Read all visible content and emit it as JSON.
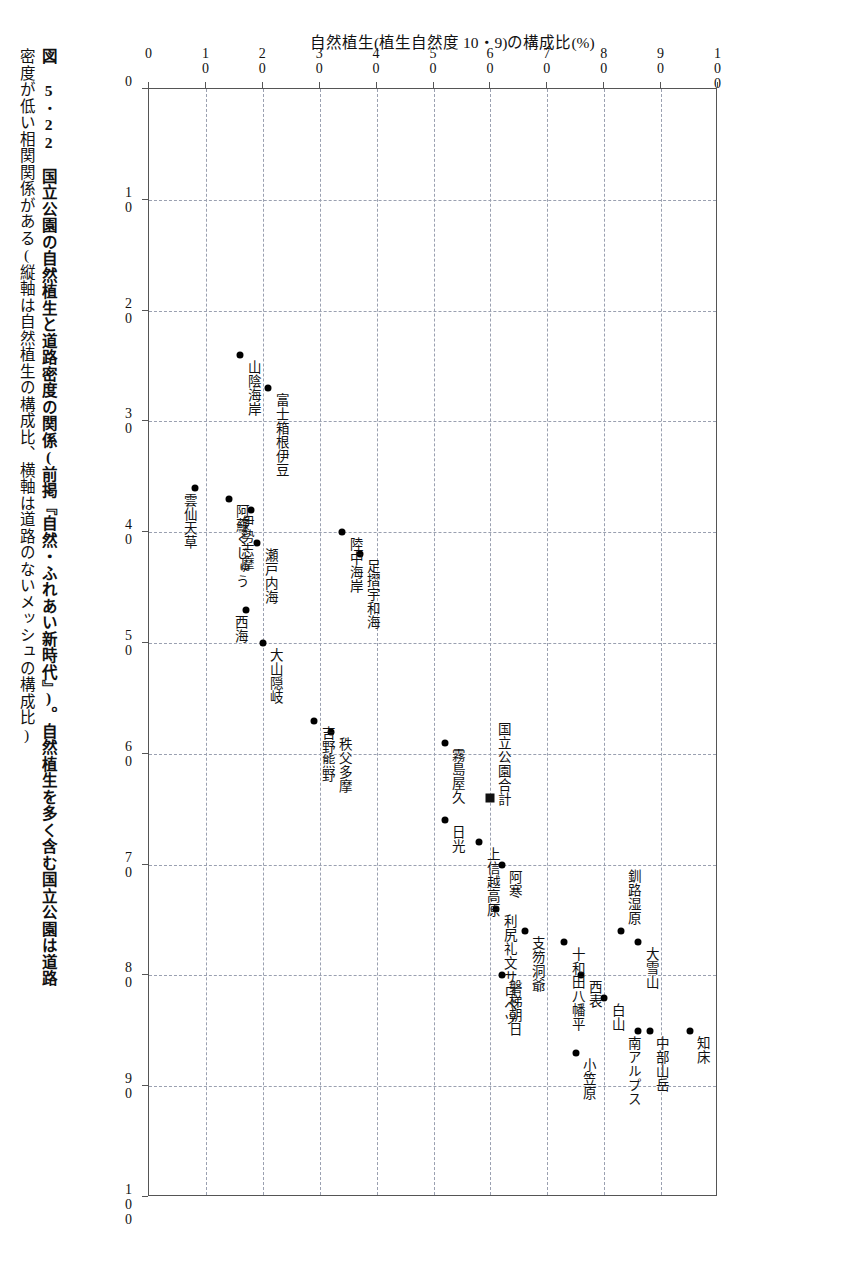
{
  "figure": {
    "number": "図 5･22",
    "caption_line1": "図 5･22　国立公園の自然植生と道路密度の関係(前掲『自然・ふれあい新時代』)。自然植生を多く含む国立公園は道路",
    "caption_line2": "密度が低い相関関係がある(縦軸は自然植生の構成比、横軸は道路のないメッシュの構成比)"
  },
  "chart_data": {
    "type": "scatter",
    "title": "",
    "xlabel": "道路(幅員 2.5 m 以上)が0本のメッシュ構成比(%)",
    "ylabel": "自然植生(植生自然度 10・9)の構成比(%)",
    "xlim": [
      0,
      100
    ],
    "ylim": [
      0,
      100
    ],
    "xticks": [
      0,
      10,
      20,
      30,
      40,
      50,
      60,
      70,
      80,
      90,
      100
    ],
    "yticks": [
      0,
      10,
      20,
      30,
      40,
      50,
      60,
      70,
      80,
      90,
      100
    ],
    "grid": "dashed",
    "legend": "none",
    "points": [
      {
        "label": "知床",
        "x": 85,
        "y": 95,
        "marker": "circle",
        "lbl_dx": 6,
        "lbl_dy": 5
      },
      {
        "label": "中部山岳",
        "x": 85,
        "y": 88,
        "marker": "circle",
        "lbl_dx": 5,
        "lbl_dy": 5
      },
      {
        "label": "南アルプス",
        "x": 85,
        "y": 86,
        "marker": "circle",
        "lbl_dx": -12,
        "lbl_dy": 5
      },
      {
        "label": "大雪山",
        "x": 77,
        "y": 86,
        "marker": "circle",
        "lbl_dx": 6,
        "lbl_dy": 5
      },
      {
        "label": "釧路湿原",
        "x": 76,
        "y": 83,
        "marker": "circle",
        "lbl_dx": 5,
        "lbl_dy": -62
      },
      {
        "label": "白山",
        "x": 82,
        "y": 80,
        "marker": "circle",
        "lbl_dx": 6,
        "lbl_dy": 5
      },
      {
        "label": "西表",
        "x": 80,
        "y": 76,
        "marker": "circle",
        "lbl_dx": 6,
        "lbl_dy": 5
      },
      {
        "label": "小笠原",
        "x": 87,
        "y": 75,
        "marker": "circle",
        "lbl_dx": 6,
        "lbl_dy": 5
      },
      {
        "label": "十和田八幡平",
        "x": 77,
        "y": 73,
        "marker": "circle",
        "lbl_dx": 6,
        "lbl_dy": 5
      },
      {
        "label": "支笏洞爺",
        "x": 76,
        "y": 66,
        "marker": "circle",
        "lbl_dx": 6,
        "lbl_dy": 5
      },
      {
        "label": "磐梯朝日",
        "x": 80,
        "y": 62,
        "marker": "circle",
        "lbl_dx": 6,
        "lbl_dy": 5
      },
      {
        "label": "利尻礼文サロベツ",
        "x": 74,
        "y": 61,
        "marker": "circle",
        "lbl_dx": 6,
        "lbl_dy": 5
      },
      {
        "label": "阿寒",
        "x": 70,
        "y": 62,
        "marker": "circle",
        "lbl_dx": 6,
        "lbl_dy": 5
      },
      {
        "label": "上信越高原",
        "x": 68,
        "y": 58,
        "marker": "circle",
        "lbl_dx": 6,
        "lbl_dy": 5
      },
      {
        "label": "国立公園合計",
        "x": 64,
        "y": 60,
        "marker": "square",
        "lbl_dx": 6,
        "lbl_dy": -76
      },
      {
        "label": "霧島屋久",
        "x": 59,
        "y": 52,
        "marker": "circle",
        "lbl_dx": 6,
        "lbl_dy": 5
      },
      {
        "label": "日光",
        "x": 66,
        "y": 52,
        "marker": "circle",
        "lbl_dx": 6,
        "lbl_dy": 5
      },
      {
        "label": "秩父多摩",
        "x": 58,
        "y": 32,
        "marker": "circle",
        "lbl_dx": 6,
        "lbl_dy": 5
      },
      {
        "label": "吉野熊野",
        "x": 57,
        "y": 29,
        "marker": "circle",
        "lbl_dx": 6,
        "lbl_dy": 5
      },
      {
        "label": "足摺宇和海",
        "x": 42,
        "y": 37,
        "marker": "circle",
        "lbl_dx": 6,
        "lbl_dy": 5
      },
      {
        "label": "陸中海岸",
        "x": 40,
        "y": 34,
        "marker": "circle",
        "lbl_dx": 6,
        "lbl_dy": 5
      },
      {
        "label": "大山隠岐",
        "x": 50,
        "y": 20,
        "marker": "circle",
        "lbl_dx": 6,
        "lbl_dy": 5
      },
      {
        "label": "西海",
        "x": 47,
        "y": 17,
        "marker": "circle",
        "lbl_dx": -12,
        "lbl_dy": 5
      },
      {
        "label": "瀬戸内海",
        "x": 41,
        "y": 19,
        "marker": "circle",
        "lbl_dx": 6,
        "lbl_dy": 5
      },
      {
        "label": "伊勢志摩",
        "x": 38,
        "y": 18,
        "marker": "circle",
        "lbl_dx": -12,
        "lbl_dy": 5
      },
      {
        "label": "阿蘇くじゅう",
        "x": 37,
        "y": 14,
        "marker": "circle",
        "lbl_dx": 6,
        "lbl_dy": 5
      },
      {
        "label": "雲仙天草",
        "x": 36,
        "y": 8,
        "marker": "circle",
        "lbl_dx": -12,
        "lbl_dy": 5
      },
      {
        "label": "富士箱根伊豆",
        "x": 27,
        "y": 21,
        "marker": "circle",
        "lbl_dx": 6,
        "lbl_dy": 5
      },
      {
        "label": "山陰海岸",
        "x": 24,
        "y": 16,
        "marker": "circle",
        "lbl_dx": 6,
        "lbl_dy": 5
      }
    ]
  },
  "page": {
    "number": ""
  }
}
